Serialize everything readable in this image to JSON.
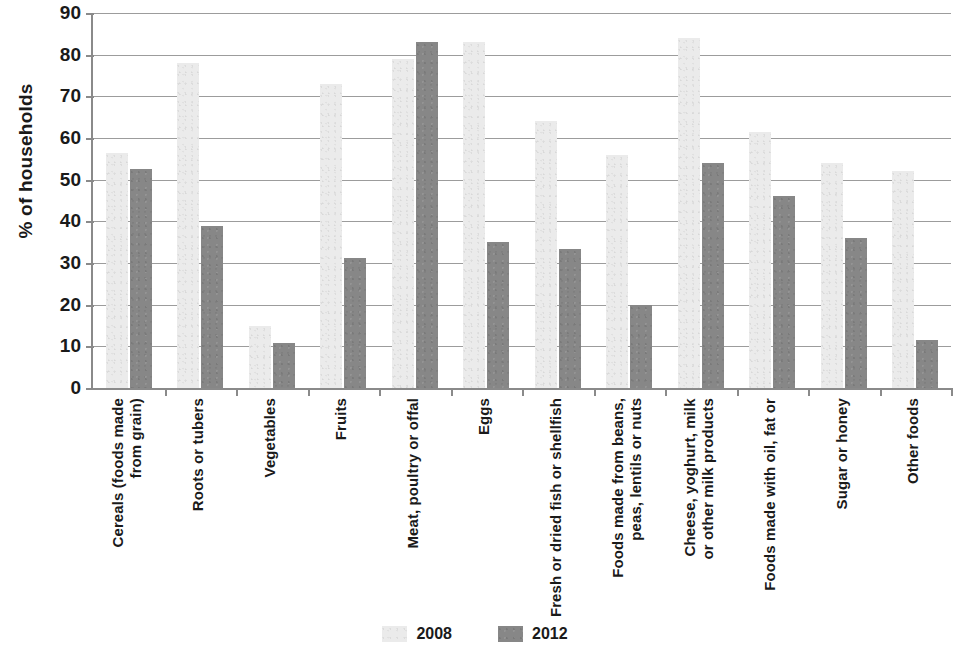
{
  "chart_data": {
    "type": "bar",
    "title": "",
    "subtitle": "",
    "xlabel": "",
    "ylabel": "% of households",
    "ylim": [
      0,
      90
    ],
    "ytick_step": 10,
    "yticks": [
      "90",
      "80",
      "70",
      "60",
      "50",
      "40",
      "30",
      "20",
      "10",
      "0"
    ],
    "grid": true,
    "legend_position": "bottom-center",
    "categories": [
      "Cereals (foods made\nfrom grain)",
      "Roots or tubers",
      "Vegetables",
      "Fruits",
      "Meat, poultry or offal",
      "Eggs",
      "Fresh or dried fish or shellfish",
      "Foods made from beans,\npeas, lentils or nuts",
      "Cheese, yoghurt, milk\nor other milk products",
      "Foods made with oil, fat or",
      "Sugar or honey",
      "Other foods"
    ],
    "series": [
      {
        "name": "2008",
        "color": "#ebebeb",
        "values": [
          56.5,
          78,
          15,
          73,
          79,
          83,
          64,
          56,
          84,
          61.5,
          54,
          52
        ]
      },
      {
        "name": "2012",
        "color": "#878787",
        "values": [
          52.5,
          39,
          10.7,
          31.3,
          83,
          35,
          33.4,
          20,
          54,
          46,
          36,
          11.5
        ]
      }
    ]
  },
  "legend": {
    "entries": [
      {
        "label": "2008"
      },
      {
        "label": "2012"
      }
    ]
  }
}
